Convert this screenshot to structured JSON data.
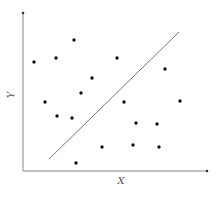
{
  "chart_data": {
    "type": "scatter",
    "title": "",
    "xlabel": "X",
    "ylabel": "Y",
    "grid": false,
    "legend": null,
    "ticks": {
      "x": [],
      "y": []
    },
    "colors": {
      "points": "#111111",
      "axes": "#888888",
      "line": "#777777"
    },
    "pixel_frame": {
      "origin_x": 23,
      "origin_y": 171,
      "x_end": 207,
      "y_top": 13
    },
    "points": [
      {
        "x": 34,
        "y": 62
      },
      {
        "x": 56,
        "y": 58
      },
      {
        "x": 74,
        "y": 40
      },
      {
        "x": 117,
        "y": 58
      },
      {
        "x": 165,
        "y": 69
      },
      {
        "x": 92,
        "y": 78
      },
      {
        "x": 81,
        "y": 93
      },
      {
        "x": 45,
        "y": 102
      },
      {
        "x": 124,
        "y": 102
      },
      {
        "x": 180,
        "y": 101
      },
      {
        "x": 57,
        "y": 116
      },
      {
        "x": 72,
        "y": 118
      },
      {
        "x": 136,
        "y": 123
      },
      {
        "x": 157,
        "y": 124
      },
      {
        "x": 102,
        "y": 147
      },
      {
        "x": 133,
        "y": 145
      },
      {
        "x": 159,
        "y": 147
      },
      {
        "x": 76,
        "y": 163
      }
    ],
    "separator_line": {
      "x1": 49,
      "y1": 159,
      "x2": 179,
      "y2": 32
    }
  }
}
